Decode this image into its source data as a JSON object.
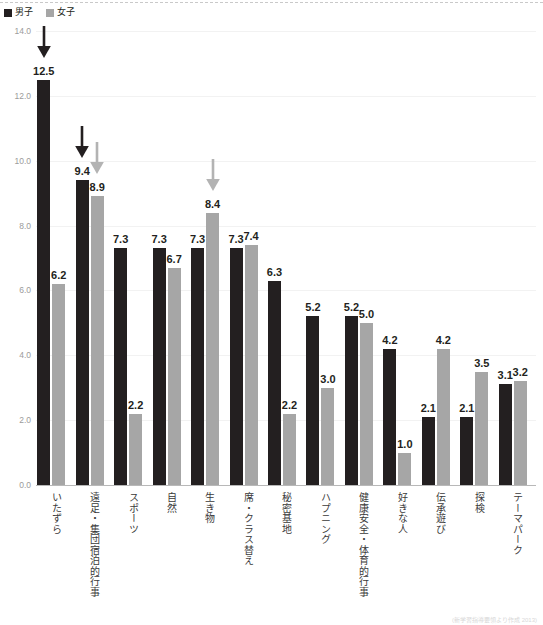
{
  "legend": {
    "position": "top-left",
    "items": [
      {
        "label": "男子",
        "color": "#231f20",
        "icon": "square-marker"
      },
      {
        "label": "女子",
        "color": "#a6a6a6",
        "icon": "square-marker"
      }
    ]
  },
  "source_note": "(新学習指導要領より作成  2013)",
  "chart_data": {
    "type": "bar",
    "title": "",
    "subtitle": "",
    "xlabel": "",
    "ylabel": "",
    "ylim": [
      0.0,
      14.0
    ],
    "ytick_step": 2.0,
    "ytick_labels": [
      "0.0",
      "2.0",
      "4.0",
      "6.0",
      "8.0",
      "10.0",
      "12.0",
      "14.0"
    ],
    "grid": true,
    "legend_position": "top-left",
    "categories": [
      "いたずら",
      "遠足・集団宿泊的行事",
      "スポーツ",
      "自然",
      "生き物",
      "席・クラス替え",
      "秘密基地",
      "ハプニング",
      "健康安全・体育的行事",
      "好きな人",
      "伝承遊び",
      "探検",
      "テーマパーク"
    ],
    "series": [
      {
        "name": "男子",
        "color": "#231f20",
        "values": [
          12.5,
          9.4,
          7.3,
          7.3,
          7.3,
          7.3,
          6.3,
          5.2,
          5.2,
          4.2,
          2.1,
          2.1,
          3.1
        ]
      },
      {
        "name": "女子",
        "color": "#a6a6a6",
        "values": [
          6.2,
          8.9,
          2.2,
          6.7,
          8.4,
          7.4,
          2.2,
          3.0,
          5.0,
          1.0,
          4.2,
          3.5,
          3.2
        ]
      }
    ],
    "data_labels": {
      "男子": [
        "12.5",
        "9.4",
        "7.3",
        "7.3",
        "7.3",
        "7.3",
        "6.3",
        "5.2",
        "5.2",
        "4.2",
        "2.1",
        "2.1",
        "3.1"
      ],
      "女子": [
        "6.2",
        "8.9",
        "2.2",
        "6.7",
        "8.4",
        "7.4",
        "2.2",
        "3.0",
        "5.0",
        "1.0",
        "4.2",
        "3.5",
        "3.2"
      ]
    },
    "annotations": [
      {
        "type": "down-arrow",
        "color": "#231f20",
        "category_index": 0,
        "series": "男子",
        "value": 12.5
      },
      {
        "type": "down-arrow",
        "color": "#231f20",
        "category_index": 1,
        "series": "男子",
        "value": 9.4
      },
      {
        "type": "down-arrow",
        "color": "#b3b3b3",
        "category_index": 1,
        "series": "女子",
        "value": 8.9
      },
      {
        "type": "down-arrow",
        "color": "#b3b3b3",
        "category_index": 4,
        "series": "女子",
        "value": 8.4
      }
    ]
  }
}
